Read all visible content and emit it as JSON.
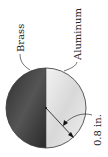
{
  "figure": {
    "labels": {
      "left_material": "Brass",
      "right_material": "Aluminum",
      "radius_dimension": "0.8 in."
    },
    "colors": {
      "brass": "#3a3a3a",
      "aluminum": "#e6e6e6",
      "outline": "#333333"
    }
  }
}
